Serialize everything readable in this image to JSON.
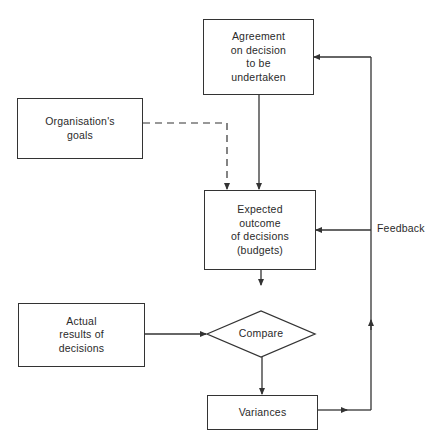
{
  "diagram": {
    "type": "flowchart",
    "nodes": {
      "agreement": {
        "label": "Agreement\non decision\nto be\nundertaken",
        "shape": "rectangle"
      },
      "goals": {
        "label": "Organisation's\ngoals",
        "shape": "rectangle"
      },
      "expected": {
        "label": "Expected\noutcome\nof decisions\n(budgets)",
        "shape": "rectangle"
      },
      "actual": {
        "label": "Actual\nresults of\ndecisions",
        "shape": "rectangle"
      },
      "compare": {
        "label": "Compare",
        "shape": "diamond"
      },
      "variances": {
        "label": "Variances",
        "shape": "rectangle"
      }
    },
    "edges": [
      {
        "from": "agreement",
        "to": "expected",
        "style": "solid"
      },
      {
        "from": "goals",
        "to": "expected",
        "style": "dashed"
      },
      {
        "from": "expected",
        "to": "compare",
        "style": "solid"
      },
      {
        "from": "actual",
        "to": "compare",
        "style": "solid"
      },
      {
        "from": "compare",
        "to": "variances",
        "style": "solid"
      },
      {
        "from": "variances",
        "to": "expected",
        "style": "solid",
        "label": "Feedback"
      },
      {
        "from": "variances",
        "to": "agreement",
        "style": "solid",
        "label": "Feedback"
      }
    ],
    "feedback_label": "Feedback",
    "line_color": "#333333"
  }
}
